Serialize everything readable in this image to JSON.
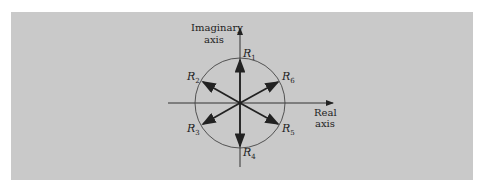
{
  "diagram": {
    "axes": {
      "imaginary_label_line1": "Imaginary",
      "imaginary_label_line2": "axis",
      "real_label_line1": "Real",
      "real_label_line2": "axis"
    },
    "phasors": [
      {
        "name": "R",
        "sub": "1",
        "angle_deg": 90
      },
      {
        "name": "R",
        "sub": "2",
        "angle_deg": 150
      },
      {
        "name": "R",
        "sub": "3",
        "angle_deg": 210
      },
      {
        "name": "R",
        "sub": "4",
        "angle_deg": 270
      },
      {
        "name": "R",
        "sub": "5",
        "angle_deg": 330
      },
      {
        "name": "R",
        "sub": "6",
        "angle_deg": 30
      }
    ],
    "colors": {
      "background": "#c9c9c9",
      "ink": "#222222"
    }
  }
}
